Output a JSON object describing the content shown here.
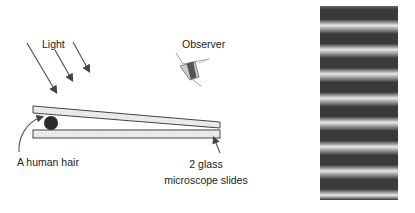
{
  "labels": {
    "light": "Light",
    "observer": "Observer",
    "hair": "A human hair",
    "slides_line1": "2 glass",
    "slides_line2": "microscope slides"
  },
  "colors": {
    "line": "#444444",
    "slide_fill": "#e6e6e6",
    "hair_fill": "#2b2b2b",
    "fringe_dark": "#3a3a3a",
    "fringe_light": "#e8e8e8"
  },
  "fringe_pattern": {
    "dark_band_count": 8,
    "description": "Alternating dark and light horizontal interference fringes"
  }
}
